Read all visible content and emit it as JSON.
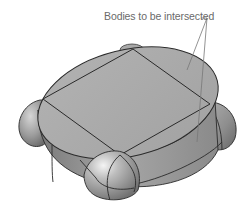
{
  "figure": {
    "callout_label": "Bodies to be intersected",
    "colors": {
      "background": "#ffffff",
      "top_face": "#a9a9a9",
      "body_light": "#c8c8c8",
      "body_mid": "#9a9a9a",
      "body_dark": "#6e6e6e",
      "edge": "#2a2a2a",
      "leader": "#777777",
      "label": "#6a6a6a"
    }
  }
}
